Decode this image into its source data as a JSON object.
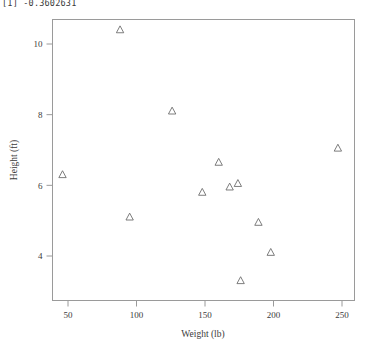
{
  "console": {
    "output_line": "[1] -0.3602631"
  },
  "chart_data": {
    "type": "scatter",
    "title": "",
    "xlabel": "Weight (lb)",
    "ylabel": "Height (ft)",
    "xlim": [
      40,
      258
    ],
    "ylim": [
      3.0,
      10.8
    ],
    "xticks": [
      50,
      100,
      150,
      200,
      250
    ],
    "yticks": [
      4,
      6,
      8,
      10
    ],
    "grid": false,
    "legend": null,
    "marker": "open-triangle",
    "marker_color": "#6e6e6e",
    "points": [
      {
        "x": 46,
        "y": 6.3
      },
      {
        "x": 88,
        "y": 10.4
      },
      {
        "x": 95,
        "y": 5.1
      },
      {
        "x": 126,
        "y": 8.1
      },
      {
        "x": 148,
        "y": 5.8
      },
      {
        "x": 160,
        "y": 6.65
      },
      {
        "x": 168,
        "y": 5.95
      },
      {
        "x": 174,
        "y": 6.05
      },
      {
        "x": 176,
        "y": 3.3
      },
      {
        "x": 189,
        "y": 4.95
      },
      {
        "x": 198,
        "y": 4.1
      },
      {
        "x": 247,
        "y": 7.05
      }
    ]
  },
  "axes": {
    "x_tick_labels": [
      "50",
      "100",
      "150",
      "200",
      "250"
    ],
    "y_tick_labels": [
      "4",
      "6",
      "8",
      "10"
    ]
  }
}
